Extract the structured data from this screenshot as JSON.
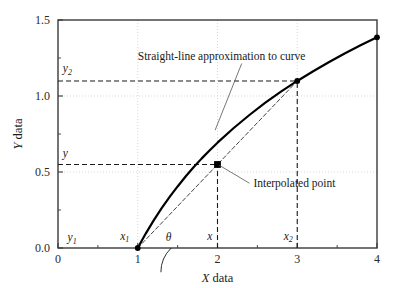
{
  "chart_data": {
    "type": "line",
    "title": "",
    "xlabel": "X data",
    "ylabel": "Y data",
    "xlim": [
      0,
      4
    ],
    "ylim": [
      0.0,
      1.5
    ],
    "grid": true,
    "legend": "none",
    "xticks": [
      0,
      1,
      2,
      3,
      4
    ],
    "xtick_labels": [
      "0",
      "1",
      "2",
      "3",
      "4"
    ],
    "yticks": [
      0.0,
      0.5,
      1.0,
      1.5
    ],
    "ytick_labels": [
      "0.0",
      "0.5",
      "1.0",
      "1.5"
    ],
    "x_minor_ticks": [
      0.5,
      1.5,
      2.5,
      3.5
    ],
    "y_minor_ticks": [
      0.25,
      0.75,
      1.25
    ],
    "series": [
      {
        "name": "curve",
        "style": "solid",
        "color": "#000000",
        "linewidth": 2.2,
        "x": [
          1.0,
          1.1,
          1.2,
          1.3,
          1.4,
          1.5,
          1.6,
          1.7,
          1.8,
          1.9,
          2.0,
          2.2,
          2.4,
          2.6,
          2.8,
          3.0,
          3.2,
          3.4,
          3.6,
          3.8,
          4.0
        ],
        "y": [
          0.0,
          0.095,
          0.182,
          0.262,
          0.336,
          0.405,
          0.47,
          0.531,
          0.588,
          0.642,
          0.693,
          0.788,
          0.875,
          0.956,
          1.03,
          1.099,
          1.163,
          1.224,
          1.281,
          1.335,
          1.386
        ]
      },
      {
        "name": "straight-line-approximation",
        "style": "dashed",
        "color": "#444444",
        "linewidth": 1.0,
        "x": [
          1.0,
          3.0
        ],
        "y": [
          0.0,
          1.099
        ]
      }
    ],
    "markers": [
      {
        "name": "point-x1",
        "shape": "circle",
        "x": 1.0,
        "y": 0.0,
        "color": "#000000"
      },
      {
        "name": "point-interpolated",
        "shape": "square",
        "x": 2.0,
        "y": 0.5495,
        "color": "#000000"
      },
      {
        "name": "point-x2",
        "shape": "circle",
        "x": 3.0,
        "y": 1.099,
        "color": "#000000"
      },
      {
        "name": "point-end",
        "shape": "circle",
        "x": 4.0,
        "y": 1.386,
        "color": "#000000"
      }
    ],
    "guide_lines": [
      {
        "name": "y2-horizontal",
        "from": [
          0,
          1.099
        ],
        "to": [
          3.0,
          1.099
        ],
        "style": "dashed"
      },
      {
        "name": "x2-vertical",
        "from": [
          3.0,
          0.0
        ],
        "to": [
          3.0,
          1.099
        ],
        "style": "dashed"
      },
      {
        "name": "y-horizontal",
        "from": [
          0,
          0.5495
        ],
        "to": [
          2.0,
          0.5495
        ],
        "style": "dashed"
      },
      {
        "name": "x-vertical",
        "from": [
          2.0,
          0.0
        ],
        "to": [
          2.0,
          0.5495
        ],
        "style": "dashed"
      }
    ],
    "annotations": [
      {
        "name": "straight-line-annotation",
        "text": "Straight-line approximation to curve",
        "anchor_x": 1.0,
        "anchor_y": 1.24,
        "target_x": 1.97,
        "target_y": 0.775
      },
      {
        "name": "interpolated-point-annotation",
        "text": "Interpolated point",
        "anchor_x": 2.45,
        "anchor_y": 0.4,
        "target_x": 2.02,
        "target_y": 0.545
      }
    ],
    "point_labels": [
      {
        "name": "label-y1",
        "text": "y",
        "sub": "1",
        "x": 0.12,
        "y": 0.045
      },
      {
        "name": "label-x1",
        "text": "x",
        "sub": "1",
        "x": 0.78,
        "y": 0.055
      },
      {
        "name": "label-theta",
        "text": "θ",
        "sub": "",
        "x": 1.35,
        "y": 0.045
      },
      {
        "name": "label-x",
        "text": "x",
        "sub": "",
        "x": 1.87,
        "y": 0.055
      },
      {
        "name": "label-x2",
        "text": "x",
        "sub": "2",
        "x": 2.83,
        "y": 0.055
      },
      {
        "name": "label-y",
        "text": "y",
        "sub": "",
        "x": 0.06,
        "y": 0.6
      },
      {
        "name": "label-y2",
        "text": "y",
        "sub": "2",
        "x": 0.06,
        "y": 1.155
      }
    ],
    "angle_arc": {
      "name": "theta-arc",
      "vertex_x": 1.0,
      "vertex_y": 0.0,
      "radius": 0.42
    }
  }
}
